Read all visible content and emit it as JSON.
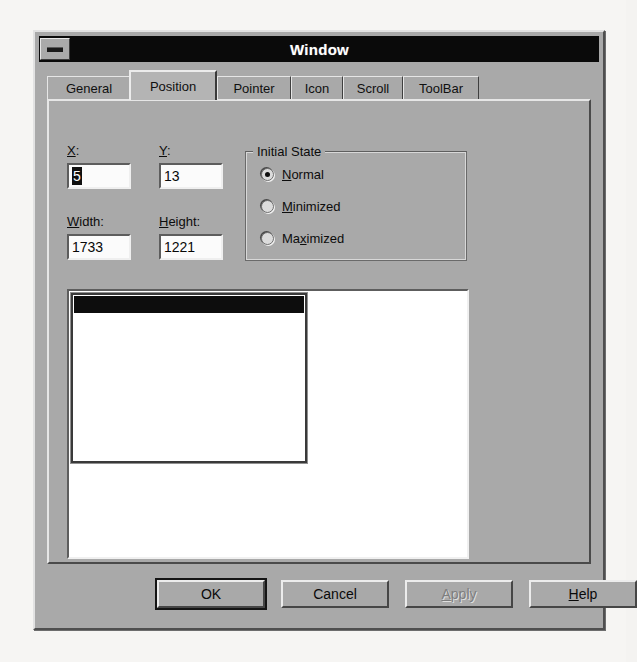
{
  "window": {
    "title": "Window",
    "sysmenu_icon": "system-menu-box-icon"
  },
  "tabs": [
    {
      "label": "General",
      "active": false
    },
    {
      "label": "Position",
      "active": true
    },
    {
      "label": "Pointer",
      "active": false
    },
    {
      "label": "Icon",
      "active": false
    },
    {
      "label": "Scroll",
      "active": false
    },
    {
      "label": "ToolBar",
      "active": false
    }
  ],
  "position_tab": {
    "fields": [
      {
        "name": "x",
        "label_pre": "",
        "label_mnemonic": "X",
        "label_post": ":",
        "value": "5",
        "selected": true
      },
      {
        "name": "y",
        "label_pre": "",
        "label_mnemonic": "Y",
        "label_post": ":",
        "value": "13",
        "selected": false
      },
      {
        "name": "width",
        "label_pre": "",
        "label_mnemonic": "W",
        "label_post": "idth:",
        "value": "1733",
        "selected": false
      },
      {
        "name": "height",
        "label_pre": "",
        "label_mnemonic": "H",
        "label_post": "eight:",
        "value": "1221",
        "selected": false
      }
    ],
    "initial_state": {
      "legend": "Initial State",
      "options": [
        {
          "pre": "",
          "mnemonic": "N",
          "post": "ormal",
          "checked": true
        },
        {
          "pre": "",
          "mnemonic": "M",
          "post": "inimized",
          "checked": false
        },
        {
          "pre": "Ma",
          "mnemonic": "x",
          "post": "imized",
          "checked": false
        }
      ]
    },
    "preview": {
      "name": "window-position-preview",
      "mini_window_title": ""
    }
  },
  "buttons": [
    {
      "name": "ok",
      "pre": "OK",
      "mnemonic": "",
      "post": "",
      "default": true,
      "disabled": false
    },
    {
      "name": "cancel",
      "pre": "Cancel",
      "mnemonic": "",
      "post": "",
      "default": false,
      "disabled": false
    },
    {
      "name": "apply",
      "pre": "",
      "mnemonic": "A",
      "post": "pply",
      "default": false,
      "disabled": true
    },
    {
      "name": "help",
      "pre": "",
      "mnemonic": "H",
      "post": "elp",
      "default": false,
      "disabled": false
    }
  ],
  "colors": {
    "face": "#a9a9a9",
    "titlebar": "#0a0a0a",
    "titlebar_text": "#ffffff",
    "field_bg": "#fbfbfb",
    "selection": "#101010",
    "disabled_text": "#7e7e7e",
    "page_bg": "#f6f5f3"
  }
}
